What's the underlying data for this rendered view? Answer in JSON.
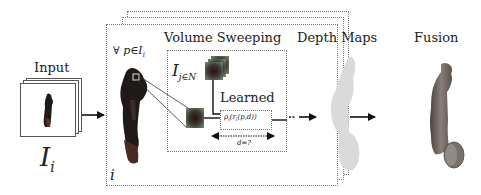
{
  "diagram": {
    "type": "pipeline",
    "stages": [
      {
        "id": "input",
        "label": "Input",
        "symbol_main": "I",
        "symbol_sub": "i"
      },
      {
        "id": "per-view",
        "quantifier": "∀ p∈I",
        "quantifier_sub": "i",
        "frame_index": "i"
      },
      {
        "id": "volume-sweeping",
        "label": "Volume Sweeping",
        "neighbors_main": "I",
        "neighbors_sub": "j∈N",
        "learned": {
          "label": "Learned",
          "function": "ρ",
          "function_sub": "i",
          "function_args_open": "(r",
          "function_args_sub": "i",
          "function_args_close": "(p,d))"
        },
        "sweep_label": "d=?"
      },
      {
        "id": "depth-maps",
        "label": "Depth Maps"
      },
      {
        "id": "fusion",
        "label": "Fusion"
      }
    ],
    "edges": [
      {
        "from": "input",
        "to": "per-view"
      },
      {
        "from": "volume-sweeping",
        "to": "depth-maps"
      },
      {
        "from": "depth-maps",
        "to": "fusion"
      }
    ],
    "colors": {
      "frame_border": "#777777",
      "arrow": "#111111",
      "text": "#222222",
      "depth_map_fill": "#d8d8d8",
      "fusion_fill": "#6e6560",
      "figure_dark": "#1f1a17"
    }
  }
}
